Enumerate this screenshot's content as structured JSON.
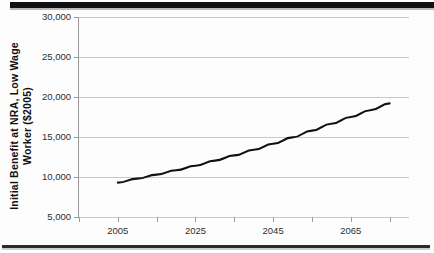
{
  "figure": {
    "ylabel_line1": "Initial Benefit at NRA, Low Wage",
    "ylabel_line2": "Worker ($2005)",
    "line_color": "#111111",
    "grid_color": "#c9c9c9",
    "axis_color": "#9b9b9b"
  },
  "chart_data": {
    "type": "line",
    "title": "",
    "subtitle": "",
    "xlabel": "",
    "ylabel": "Initial Benefit at NRA, Low Wage Worker ($2005)",
    "xlim": [
      1995,
      2080
    ],
    "ylim": [
      5000,
      30000
    ],
    "grid": true,
    "grid_axis": "y",
    "legend": false,
    "legend_position": "none",
    "x_ticks": [
      1995,
      2005,
      2015,
      2025,
      2035,
      2045,
      2055,
      2065,
      2075
    ],
    "x_tick_labels": [
      "",
      "2005",
      "",
      "2025",
      "",
      "2045",
      "",
      "2065",
      ""
    ],
    "y_ticks": [
      5000,
      10000,
      15000,
      20000,
      25000,
      30000
    ],
    "y_tick_labels": [
      "5,000",
      "10,000",
      "15,000",
      "20,000",
      "25,000",
      "30,000"
    ],
    "series": [
      {
        "name": "Initial Benefit at NRA, Low Wage Worker",
        "color": "#111111",
        "x": [
          2005,
          2010,
          2015,
          2020,
          2025,
          2030,
          2035,
          2040,
          2045,
          2050,
          2055,
          2060,
          2065,
          2070,
          2075
        ],
        "values": [
          9300,
          9800,
          10300,
          10850,
          11400,
          12050,
          12700,
          13400,
          14150,
          14950,
          15800,
          16650,
          17500,
          18350,
          19200
        ]
      }
    ]
  }
}
